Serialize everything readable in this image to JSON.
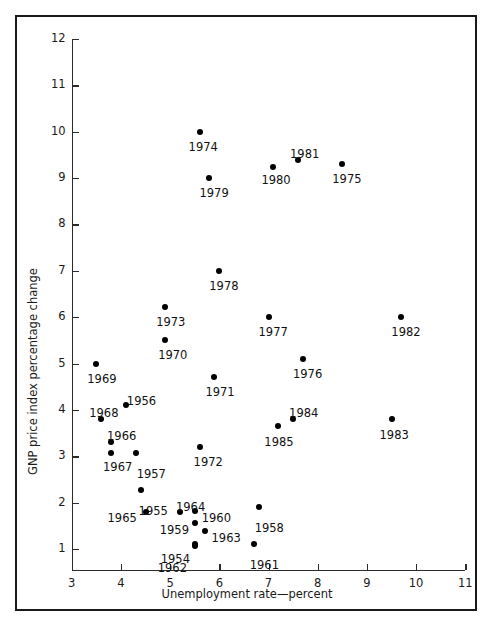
{
  "figure": {
    "background_color": "#ffffff",
    "frame_color": "#1a1a1a",
    "marker_color": "#000000"
  },
  "chart_data": {
    "type": "scatter",
    "title": "",
    "xlabel": "Unemployment rate—percent",
    "ylabel": "GNP price index percentage change",
    "xlim": [
      3,
      11
    ],
    "ylim": [
      0.45,
      12
    ],
    "xticks": [
      3,
      4,
      5,
      6,
      7,
      8,
      9,
      10,
      11
    ],
    "xtick_labels": [
      "3",
      "4",
      "5",
      "6",
      "7",
      "8",
      "9",
      "10",
      "11"
    ],
    "yticks": [
      1,
      2,
      3,
      4,
      5,
      6,
      7,
      8,
      9,
      10,
      11,
      12
    ],
    "ytick_labels": [
      "1",
      "2",
      "3",
      "4",
      "5",
      "6",
      "7",
      "8",
      "9",
      "10",
      "11",
      "12"
    ],
    "grid": false,
    "legend": "none",
    "point_label_field": "label",
    "points": [
      {
        "label": "1954",
        "x": 5.5,
        "y": 1.1,
        "lx": -34,
        "ly": 10
      },
      {
        "label": "1955",
        "x": 4.4,
        "y": 2.28,
        "lx": -2,
        "ly": 16
      },
      {
        "label": "1956",
        "x": 4.1,
        "y": 4.1,
        "lx": 1,
        "ly": -9
      },
      {
        "label": "1957",
        "x": 4.3,
        "y": 3.08,
        "lx": 1,
        "ly": 16
      },
      {
        "label": "1958",
        "x": 6.8,
        "y": 1.9,
        "lx": -4,
        "ly": 16
      },
      {
        "label": "1959",
        "x": 5.5,
        "y": 1.57,
        "lx": -35,
        "ly": 2
      },
      {
        "label": "1960",
        "x": 5.5,
        "y": 1.82,
        "lx": 7,
        "ly": 2
      },
      {
        "label": "1961",
        "x": 6.7,
        "y": 1.1,
        "lx": -4,
        "ly": 16
      },
      {
        "label": "1962",
        "x": 5.5,
        "y": 1.06,
        "lx": -37,
        "ly": 17
      },
      {
        "label": "1963",
        "x": 5.7,
        "y": 1.38,
        "lx": 7,
        "ly": 2
      },
      {
        "label": "1964",
        "x": 5.2,
        "y": 1.8,
        "lx": -4,
        "ly": -10
      },
      {
        "label": "1965",
        "x": 4.5,
        "y": 1.8,
        "lx": -38,
        "ly": 1
      },
      {
        "label": "1966",
        "x": 3.8,
        "y": 3.3,
        "lx": -4,
        "ly": -11
      },
      {
        "label": "1967",
        "x": 3.8,
        "y": 3.08,
        "lx": -8,
        "ly": 9
      },
      {
        "label": "1968",
        "x": 3.6,
        "y": 3.8,
        "lx": -12,
        "ly": -11
      },
      {
        "label": "1969",
        "x": 3.5,
        "y": 5.0,
        "lx": -9,
        "ly": 10
      },
      {
        "label": "1970",
        "x": 4.9,
        "y": 5.5,
        "lx": -7,
        "ly": 10
      },
      {
        "label": "1971",
        "x": 5.9,
        "y": 4.7,
        "lx": -9,
        "ly": 10
      },
      {
        "label": "1972",
        "x": 5.6,
        "y": 3.2,
        "lx": -6,
        "ly": 10
      },
      {
        "label": "1973",
        "x": 4.9,
        "y": 6.22,
        "lx": -9,
        "ly": 10
      },
      {
        "label": "1974",
        "x": 5.6,
        "y": 10.0,
        "lx": -11,
        "ly": 10
      },
      {
        "label": "1975",
        "x": 8.5,
        "y": 9.3,
        "lx": -10,
        "ly": 10
      },
      {
        "label": "1976",
        "x": 7.7,
        "y": 5.1,
        "lx": -10,
        "ly": 10
      },
      {
        "label": "1977",
        "x": 7.0,
        "y": 6.0,
        "lx": -10,
        "ly": 10
      },
      {
        "label": "1978",
        "x": 6.0,
        "y": 7.0,
        "lx": -10,
        "ly": 10
      },
      {
        "label": "1979",
        "x": 5.8,
        "y": 9.0,
        "lx": -10,
        "ly": 10
      },
      {
        "label": "1980",
        "x": 7.1,
        "y": 9.25,
        "lx": -12,
        "ly": 8
      },
      {
        "label": "1981",
        "x": 7.6,
        "y": 9.4,
        "lx": -8,
        "ly": -11
      },
      {
        "label": "1982",
        "x": 9.7,
        "y": 6.0,
        "lx": -10,
        "ly": 10
      },
      {
        "label": "1983",
        "x": 9.5,
        "y": 3.8,
        "lx": -12,
        "ly": 11
      },
      {
        "label": "1984",
        "x": 7.5,
        "y": 3.8,
        "lx": -4,
        "ly": -11
      },
      {
        "label": "1985",
        "x": 7.2,
        "y": 3.65,
        "lx": -14,
        "ly": 11
      }
    ]
  }
}
